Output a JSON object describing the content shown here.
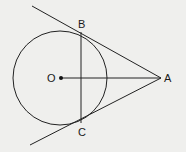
{
  "diagram": {
    "title": "",
    "points": {
      "O": {
        "label": "O",
        "role": "circle center"
      },
      "A": {
        "label": "A",
        "role": "external point"
      },
      "B": {
        "label": "B",
        "role": "tangent point"
      },
      "C": {
        "label": "C",
        "role": "tangent point"
      }
    },
    "elements": [
      {
        "type": "circle",
        "center": "O"
      },
      {
        "type": "tangent-line",
        "through": [
          "A",
          "B"
        ]
      },
      {
        "type": "tangent-line",
        "through": [
          "A",
          "C"
        ]
      },
      {
        "type": "segment",
        "through": [
          "B",
          "C"
        ]
      },
      {
        "type": "segment",
        "through": [
          "O",
          "A"
        ]
      }
    ],
    "colors": {
      "stroke": "#222222",
      "background": "#efefed"
    }
  }
}
